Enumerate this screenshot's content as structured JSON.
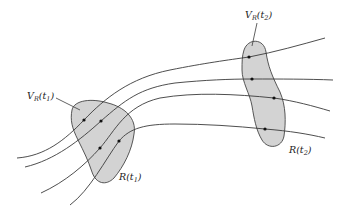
{
  "figure": {
    "colors": {
      "region_fill": "#d3d3d3",
      "stroke": "#3a3a3a",
      "dot": "#111111",
      "background": "#ffffff"
    }
  },
  "labels": {
    "v1": {
      "main": "V",
      "sub": "R",
      "arg": "(t",
      "argsub": "1",
      "close": ")"
    },
    "v2": {
      "main": "V",
      "sub": "R",
      "arg": "(t",
      "argsub": "2",
      "close": ")"
    },
    "r1": {
      "main": "R",
      "arg": "(t",
      "argsub": "1",
      "close": ")"
    },
    "r2": {
      "main": "R",
      "arg": "(t",
      "argsub": "2",
      "close": ")"
    }
  },
  "regions": [
    {
      "id": "R(t1)",
      "fill": "#d3d3d3"
    },
    {
      "id": "R(t2)",
      "fill": "#d3d3d3"
    }
  ],
  "trajectories": 4,
  "points_per_region": 4
}
